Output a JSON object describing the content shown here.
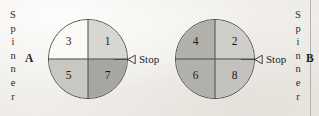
{
  "figure": {
    "background_color": "#f2f0ec",
    "rule_color": "#a9a6a0"
  },
  "left_label": {
    "word": "Spinner",
    "letters": [
      "S",
      "p",
      "i",
      "n",
      "n",
      "e",
      "r"
    ],
    "letter": "A"
  },
  "right_label": {
    "word": "Spinner",
    "letters": [
      "S",
      "p",
      "i",
      "n",
      "n",
      "e",
      "r"
    ],
    "letter": "B"
  },
  "spinner_a": {
    "name": "Spinner A",
    "outline_color": "#4a4a4a",
    "sectors": [
      {
        "position": "upper-left",
        "value": "3",
        "color": "#faf9f6"
      },
      {
        "position": "upper-right",
        "value": "1",
        "color": "#d8d6d1"
      },
      {
        "position": "lower-left",
        "value": "5",
        "color": "#c9c7c1"
      },
      {
        "position": "lower-right",
        "value": "7",
        "color": "#a8a6a1"
      }
    ],
    "stop": {
      "label": "Stop",
      "pointer_icon": "left-triangle-outline-icon"
    }
  },
  "spinner_b": {
    "name": "Spinner B",
    "outline_color": "#4a4a4a",
    "sectors": [
      {
        "position": "upper-left",
        "value": "4",
        "color": "#b2b0ab"
      },
      {
        "position": "upper-right",
        "value": "2",
        "color": "#d0cec9"
      },
      {
        "position": "lower-left",
        "value": "6",
        "color": "#b2b0ab"
      },
      {
        "position": "lower-right",
        "value": "8",
        "color": "#c4c2bd"
      }
    ],
    "stop": {
      "label": "Stop",
      "pointer_icon": "left-triangle-outline-icon"
    }
  }
}
